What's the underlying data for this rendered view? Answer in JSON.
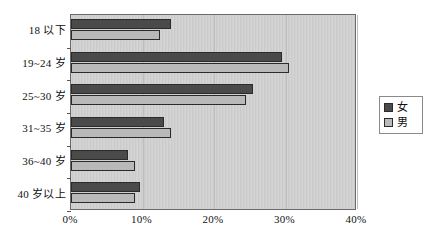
{
  "chart_data": {
    "type": "bar",
    "orientation": "horizontal",
    "title": "",
    "subtitle": "",
    "xlabel": "",
    "ylabel": "",
    "xlim": [
      0,
      40
    ],
    "grid": true,
    "grid_axis": "x",
    "legend_position": "right",
    "categories": [
      "18 以下",
      "19~24 岁",
      "25~30 岁",
      "31~35 岁",
      "36~40 岁",
      "40 岁以上"
    ],
    "xticks": [
      0,
      10,
      20,
      30,
      40
    ],
    "xticklabels": [
      "0%",
      "10%",
      "20%",
      "30%",
      "40%"
    ],
    "series": [
      {
        "name": "女",
        "color": "#4a4a4a",
        "values": [
          14.0,
          29.5,
          25.5,
          13.0,
          8.0,
          9.7
        ]
      },
      {
        "name": "男",
        "color": "#b9b9b9",
        "values": [
          12.5,
          30.5,
          24.5,
          14.0,
          9.0,
          9.0
        ]
      }
    ]
  },
  "legend": {
    "entries": [
      {
        "label": "女",
        "swatch": "#4a4a4a"
      },
      {
        "label": "男",
        "swatch": "#b9b9b9"
      }
    ]
  }
}
